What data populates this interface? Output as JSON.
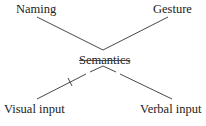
{
  "diagram": {
    "nodes": {
      "top_left": "Naming",
      "top_right": "Gesture",
      "center": "Semantics",
      "bottom_left": "Visual input",
      "bottom_right": "Verbal input"
    },
    "edges": [
      {
        "from": "Naming",
        "to": "Semantics"
      },
      {
        "from": "Gesture",
        "to": "Semantics"
      },
      {
        "from": "Visual input",
        "to": "Semantics",
        "marked_break": true
      },
      {
        "from": "Verbal input",
        "to": "Semantics"
      }
    ],
    "line_color": "#333333"
  }
}
